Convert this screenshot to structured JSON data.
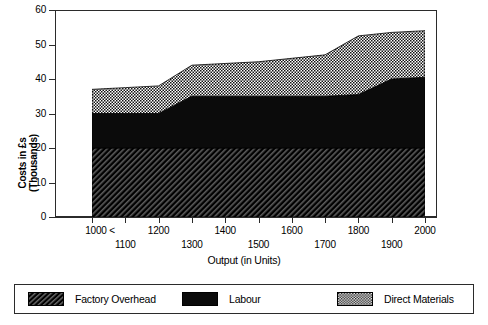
{
  "chart_data": {
    "type": "area",
    "title": "",
    "subtitle": "",
    "xlabel": "Output (in Units)",
    "ylabel": "Costs in £s (Thousands)",
    "stacked": true,
    "grid": false,
    "legend_position": "bottom",
    "x": [
      1000,
      1100,
      1200,
      1300,
      1400,
      1500,
      1600,
      1700,
      1800,
      1900,
      2000
    ],
    "xlim": [
      1000,
      2000
    ],
    "ylim": [
      0,
      60
    ],
    "xticks": [
      1000,
      1100,
      1200,
      1300,
      1400,
      1500,
      1600,
      1700,
      1800,
      1900,
      2000
    ],
    "xtick_labels_row1": [
      "1000 <",
      "1200",
      "1400",
      "1600",
      "1800",
      "2000"
    ],
    "xtick_labels_row2": [
      "1100",
      "1300",
      "1500",
      "1700",
      "1900"
    ],
    "yticks": [
      0,
      10,
      20,
      30,
      40,
      50,
      60
    ],
    "ytick_labels": [
      "0",
      "10",
      "20",
      "30",
      "40",
      "50",
      "60"
    ],
    "series": [
      {
        "name": "Factory Overhead",
        "pattern": "diagonal-hatch",
        "color": "#1a1a1a",
        "values": [
          20,
          20,
          20,
          20,
          20,
          20,
          20,
          20,
          20,
          20,
          20
        ],
        "cumulative": [
          20,
          20,
          20,
          20,
          20,
          20,
          20,
          20,
          20,
          20,
          20
        ]
      },
      {
        "name": "Labour",
        "pattern": "solid",
        "color": "#0a0a0a",
        "values": [
          10,
          10,
          10,
          15,
          15,
          15,
          15,
          15,
          15.5,
          20,
          20.5
        ],
        "cumulative": [
          30,
          30,
          30,
          35,
          35,
          35,
          35,
          35,
          35.5,
          40,
          40.5
        ]
      },
      {
        "name": "Direct Materials",
        "pattern": "checker",
        "color": "#8c8c8c",
        "values": [
          7,
          7.5,
          8,
          9,
          9.5,
          10,
          11,
          12,
          17,
          13.5,
          13.5
        ],
        "cumulative": [
          37,
          37.5,
          38,
          44,
          44.5,
          45,
          46,
          47,
          52.5,
          53.5,
          54
        ]
      }
    ]
  },
  "axes": {
    "y_title": "Costs in £s",
    "y_title_line2": "(Thousands)",
    "y_ticks": [
      "60",
      "50",
      "40",
      "30",
      "20",
      "10",
      "0"
    ],
    "x_title": "Output (in Units)",
    "x_row1": [
      "1000 <",
      "1200",
      "1400",
      "1600",
      "1800",
      "2000"
    ],
    "x_row2": [
      "1100",
      "1300",
      "1500",
      "1700",
      "1900"
    ]
  },
  "legend": {
    "items": [
      {
        "label": "Factory Overhead",
        "pattern": "diagonal-hatch"
      },
      {
        "label": "Labour",
        "pattern": "solid"
      },
      {
        "label": "Direct Materials",
        "pattern": "checker"
      }
    ]
  }
}
